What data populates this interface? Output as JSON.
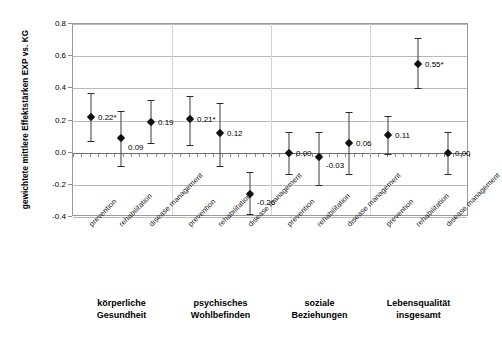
{
  "chart_data": {
    "type": "scatter",
    "title": "",
    "xlabel": "",
    "ylabel": "gewichtete mittlere Effektstärken EXP vs. KG",
    "ylim": [
      -0.4,
      0.8
    ],
    "ytick_labels": [
      "0.8",
      "0.6",
      "0.4",
      "0.2",
      "0.0",
      "-0.2",
      "-0.4"
    ],
    "ytick_values": [
      0.8,
      0.6,
      0.4,
      0.2,
      0.0,
      -0.2,
      -0.4
    ],
    "grid": true,
    "legend": "none",
    "categories": [
      "prevention",
      "rehabilitation",
      "disease management"
    ],
    "groups": [
      {
        "caption": "körperliche\nGesundheit",
        "points": [
          {
            "category": "prevention",
            "label": "0.22*",
            "value": 0.22,
            "ci_low": 0.07,
            "ci_high": 0.37
          },
          {
            "category": "rehabilitation",
            "label": "0.09",
            "value": 0.09,
            "ci_low": -0.08,
            "ci_high": 0.26
          },
          {
            "category": "disease management",
            "label": "0.19",
            "value": 0.19,
            "ci_low": 0.06,
            "ci_high": 0.33
          }
        ]
      },
      {
        "caption": "psychisches\nWohlbefinden",
        "points": [
          {
            "category": "prevention",
            "label": "0.21*",
            "value": 0.21,
            "ci_low": 0.05,
            "ci_high": 0.35
          },
          {
            "category": "rehabilitation",
            "label": "0.12",
            "value": 0.12,
            "ci_low": -0.08,
            "ci_high": 0.31
          },
          {
            "category": "disease management",
            "label": "-0.26",
            "value": -0.26,
            "ci_low": -0.38,
            "ci_high": -0.12
          }
        ]
      },
      {
        "caption": "soziale\nBeziehungen",
        "points": [
          {
            "category": "prevention",
            "label": "0.00",
            "value": 0.0,
            "ci_low": -0.13,
            "ci_high": 0.13
          },
          {
            "category": "rehabilitation",
            "label": "-0.03",
            "value": -0.03,
            "ci_low": -0.2,
            "ci_high": 0.13
          },
          {
            "category": "disease management",
            "label": "0.06",
            "value": 0.06,
            "ci_low": -0.13,
            "ci_high": 0.25
          }
        ]
      },
      {
        "caption": "Lebensqualität\ninsgesamt",
        "points": [
          {
            "category": "prevention",
            "label": "0.11",
            "value": 0.11,
            "ci_low": -0.01,
            "ci_high": 0.23
          },
          {
            "category": "rehabilitation",
            "label": "0.55*",
            "value": 0.55,
            "ci_low": 0.4,
            "ci_high": 0.71
          },
          {
            "category": "disease management",
            "label": "0.00",
            "value": 0.0,
            "ci_low": -0.13,
            "ci_high": 0.13
          }
        ]
      }
    ]
  },
  "colors": {
    "marker": "#111111",
    "errorbar": "#3b3b3b",
    "gridline": "#b9b9b9",
    "zeroline": "#6e6e6e",
    "frame": "#9a9a9a"
  }
}
